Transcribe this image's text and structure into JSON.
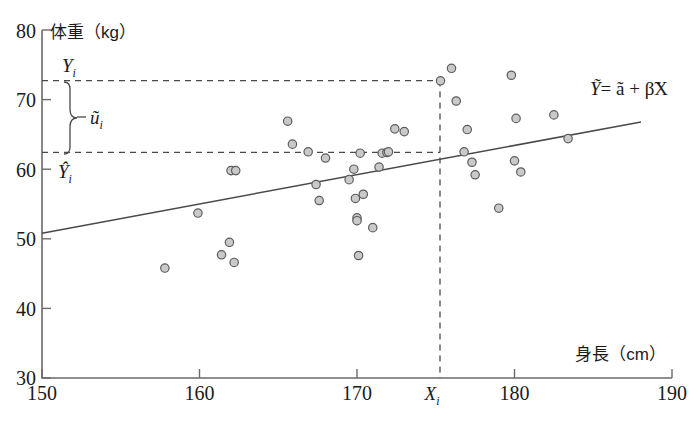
{
  "chart_data": {
    "type": "scatter",
    "title": "",
    "xlabel": "身長（cm）",
    "ylabel": "体重（kg）",
    "xlim": [
      150,
      190
    ],
    "ylim": [
      30,
      80
    ],
    "xticks": [
      150,
      160,
      170,
      180,
      190
    ],
    "yticks": [
      30,
      40,
      50,
      60,
      70,
      80
    ],
    "xtick_labels": [
      "150",
      "160",
      "170",
      "180",
      "190"
    ],
    "ytick_labels": [
      "30",
      "40",
      "50",
      "60",
      "70",
      "80"
    ],
    "grid": false,
    "legend": "none",
    "point_color": "#c9c9c9",
    "point_edge_color": "#5d5d5d",
    "line_color": "#4a4a4a",
    "x": [
      157.8,
      159.9,
      161.4,
      161.9,
      162.0,
      162.2,
      162.3,
      165.6,
      165.9,
      166.9,
      167.4,
      167.6,
      168.0,
      169.5,
      169.8,
      169.9,
      170.0,
      170.0,
      170.1,
      170.2,
      170.4,
      171.0,
      171.4,
      171.6,
      171.9,
      172.0,
      172.4,
      173.0,
      175.3,
      176.0,
      176.3,
      176.8,
      177.0,
      177.3,
      177.5,
      179.0,
      179.8,
      180.0,
      180.1,
      180.4,
      182.5,
      183.4
    ],
    "y": [
      45.8,
      53.7,
      47.7,
      49.5,
      59.8,
      46.6,
      59.8,
      66.9,
      63.6,
      62.5,
      57.8,
      55.5,
      61.6,
      58.5,
      60.0,
      55.8,
      53.0,
      52.6,
      47.6,
      62.3,
      56.4,
      51.6,
      60.3,
      62.3,
      62.4,
      62.5,
      65.8,
      65.4,
      72.7,
      74.5,
      69.8,
      62.5,
      65.7,
      61.0,
      59.2,
      54.4,
      73.5,
      61.2,
      67.3,
      59.6,
      67.8,
      64.4
    ],
    "series": [
      {
        "name": "observations",
        "points": [
          [
            157.8,
            45.8
          ],
          [
            159.9,
            53.7
          ],
          [
            161.4,
            47.7
          ],
          [
            161.9,
            49.5
          ],
          [
            162.0,
            59.8
          ],
          [
            162.2,
            46.6
          ],
          [
            162.3,
            59.8
          ],
          [
            165.6,
            66.9
          ],
          [
            165.9,
            63.6
          ],
          [
            166.9,
            62.5
          ],
          [
            167.4,
            57.8
          ],
          [
            167.6,
            55.5
          ],
          [
            168.0,
            61.6
          ],
          [
            169.5,
            58.5
          ],
          [
            169.8,
            60.0
          ],
          [
            169.9,
            55.8
          ],
          [
            170.0,
            53.0
          ],
          [
            170.0,
            52.6
          ],
          [
            170.1,
            47.6
          ],
          [
            170.2,
            62.3
          ],
          [
            170.4,
            56.4
          ],
          [
            171.0,
            51.6
          ],
          [
            171.4,
            60.3
          ],
          [
            171.6,
            62.3
          ],
          [
            171.9,
            62.4
          ],
          [
            172.0,
            62.5
          ],
          [
            172.4,
            65.8
          ],
          [
            173.0,
            65.4
          ],
          [
            175.3,
            72.7
          ],
          [
            176.0,
            74.5
          ],
          [
            176.3,
            69.8
          ],
          [
            176.8,
            62.5
          ],
          [
            177.0,
            65.7
          ],
          [
            177.3,
            61.0
          ],
          [
            177.5,
            59.2
          ],
          [
            179.0,
            54.4
          ],
          [
            179.8,
            73.5
          ],
          [
            180.0,
            61.2
          ],
          [
            180.1,
            67.3
          ],
          [
            180.4,
            59.6
          ],
          [
            182.5,
            67.8
          ],
          [
            183.4,
            64.4
          ]
        ]
      }
    ],
    "fit_line": {
      "label": "Ỹ = ã + β̃X",
      "x_start": 150.0,
      "y_start": 50.8,
      "x_end": 188.0,
      "y_end": 66.8
    },
    "annotations": {
      "observed_value": "Yi",
      "observed_value_y": 72.7,
      "fitted_value": "Ŷi",
      "fitted_value_y": 62.4,
      "residual": "ũi",
      "x_marker": "Xi",
      "x_marker_x": 175.3,
      "equation": "Ỹ = ã + β̃X"
    }
  },
  "labels": {
    "y_axis_title": "体重（kg）",
    "x_axis_title": "身長（cm）",
    "y_tick_80": "80",
    "y_tick_70": "70",
    "y_tick_60": "60",
    "y_tick_50": "50",
    "y_tick_40": "40",
    "y_tick_30": "30",
    "x_tick_150": "150",
    "x_tick_160": "160",
    "x_tick_170": "170",
    "x_tick_180": "180",
    "x_tick_190": "190",
    "eq_Y": "Ỹ",
    "eq_rest": "= ã + β̃X",
    "obs_base": "Y",
    "obs_sub": "i",
    "fit_base": "Ŷ",
    "fit_sub": "i",
    "resid_base": "ũ",
    "resid_sub": "i",
    "xmark_base": "X",
    "xmark_sub": "i"
  }
}
